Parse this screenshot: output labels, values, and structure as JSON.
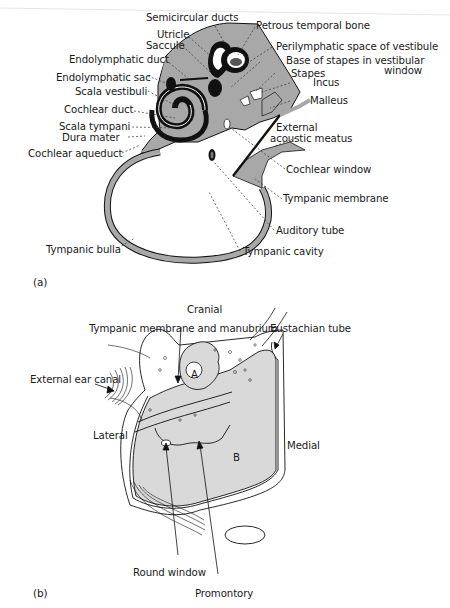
{
  "figure": {
    "panel_a": {
      "label": "(a)",
      "labels": {
        "semicircular_ducts": "Semicircular ducts",
        "petrous_temporal_bone": "Petrous temporal bone",
        "utricle": "Utricle",
        "saccule": "Saccule",
        "perilymphatic_space": "Perilymphatic space of vestibule",
        "base_of_stapes_line1": "Base of stapes in vestibular",
        "base_of_stapes_line2": "window",
        "endolymphatic_duct": "Endolymphatic duct",
        "stapes": "Stapes",
        "endolymphatic_sac": "Endolymphatic sac",
        "incus": "Incus",
        "scala_vestibuli": "Scala vestibuli",
        "malleus": "Malleus",
        "cochlear_duct": "Cochlear duct",
        "scala_tympani": "Scala tympani",
        "external_acoustic_meatus_line1": "External",
        "external_acoustic_meatus_line2": "acoustic meatus",
        "dura_mater": "Dura mater",
        "cochlear_aqueduct": "Cochlear aqueduct",
        "cochlear_window": "Cochlear window",
        "tympanic_membrane": "Tympanic membrane",
        "auditory_tube": "Auditory tube",
        "tympanic_bulla": "Tympanic bulla",
        "tympanic_cavity": "Tympanic cavity"
      }
    },
    "panel_b": {
      "label": "(b)",
      "labels": {
        "cranial": "Cranial",
        "tympanic_membrane_manubrium": "Tympanic membrane and manubrium",
        "eustachian_tube": "Eustachian tube",
        "external_ear_canal": "External ear canal",
        "lateral": "Lateral",
        "medial": "Medial",
        "compartment_a": "A",
        "compartment_b": "B",
        "round_window": "Round window",
        "promontory": "Promontory"
      }
    },
    "colors": {
      "bone_fill": "#a8a8a8",
      "light_fill": "#d9d9d9",
      "ink": "#111111",
      "background": "#ffffff"
    }
  }
}
